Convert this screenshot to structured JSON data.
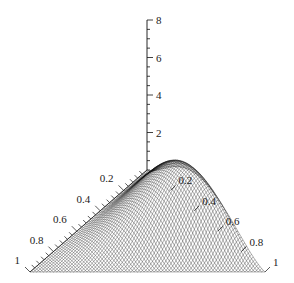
{
  "chart_data": {
    "type": "surface3d",
    "title": "",
    "domain": "2-simplex (triangular base)",
    "z_axis": {
      "label": "",
      "range": [
        0,
        8
      ],
      "major_ticks": [
        2,
        4,
        6,
        8
      ],
      "tick_labels": [
        "2",
        "4",
        "6",
        "8"
      ],
      "minor_step": 0.5
    },
    "left_axis": {
      "label": "",
      "range": [
        0,
        1
      ],
      "tick_labels": [
        "0.2",
        "0.4",
        "0.6",
        "0.8",
        "1"
      ],
      "tick_values": [
        0.2,
        0.4,
        0.6,
        0.8,
        1
      ]
    },
    "right_axis": {
      "label": "",
      "range": [
        0,
        1
      ],
      "tick_labels": [
        "0.2",
        "0.4",
        "0.6",
        "0.8",
        "1"
      ],
      "tick_values": [
        0.2,
        0.4,
        0.6,
        0.8,
        1
      ]
    },
    "surface": {
      "description": "Unimodal density over the simplex, peak located toward the right edge",
      "peak": {
        "left": 0.15,
        "right": 0.45,
        "z": 2.8
      },
      "max_z_approx": 2.8
    },
    "grid": false,
    "legend": null
  },
  "style": {
    "line_color": "#111111",
    "background": "#ffffff"
  }
}
